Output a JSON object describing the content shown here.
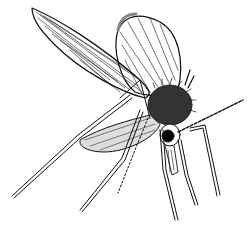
{
  "image": {
    "subject": "sand fly insect line drawing",
    "style": "black ink illustration on white",
    "background": "#ffffff",
    "ink": "#111111"
  }
}
